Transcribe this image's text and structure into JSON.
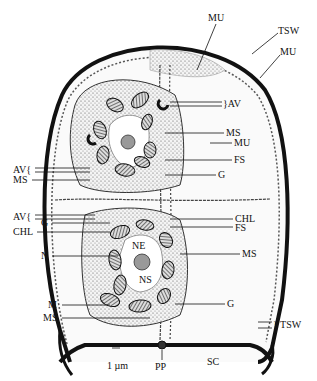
{
  "figure": {
    "type": "schematic cross-section of a cell within a tetraspore/sporangial wall",
    "scale_bar": "1 µm",
    "labels": {
      "mu_top": "MU",
      "tsw_top": "TSW",
      "mu_right": "MU",
      "av_upper_right": "}AV",
      "ms_upper_right": "MS",
      "mu_mid_right": "MU",
      "fs_upper_right": "FS",
      "g_upper_right": "G",
      "av_upper_left": "AV{",
      "ms_upper_left": "MS",
      "av_lower_left": "AV{",
      "g_lower_left": "G",
      "chl_lower_left": "CHL",
      "chl_lower_right": "CHL",
      "fs_lower_right": "FS",
      "ne_center": "NE",
      "n_left": "N",
      "ns_center": "NS",
      "ms_lower_right": "MS",
      "m_left": "M",
      "g_lower_right": "G",
      "ms_lower_left": "MS",
      "tsw_bottom": "} TSW",
      "pp_bottom": "PP",
      "sc_bottom": "SC"
    }
  }
}
